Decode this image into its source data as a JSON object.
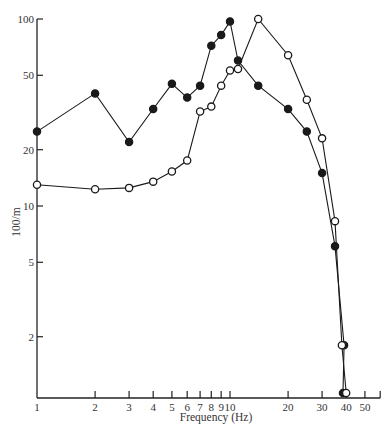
{
  "chart_data": {
    "type": "line",
    "title": "",
    "xlabel": "Frequency (Hz)",
    "ylabel": "100/m",
    "xscale": "log",
    "yscale": "log",
    "xlim": [
      1,
      60
    ],
    "ylim": [
      1,
      100
    ],
    "grid": false,
    "legend": null,
    "xticks": [
      1,
      2,
      3,
      4,
      5,
      6,
      7,
      8,
      9,
      10,
      20,
      30,
      40,
      50
    ],
    "xtick_labels": [
      "1",
      "2",
      "3",
      "4",
      "5",
      "6",
      "7",
      "8",
      "9",
      "10",
      "20",
      "30",
      "40",
      "50"
    ],
    "yticks": [
      2,
      5,
      10,
      20,
      50,
      100
    ],
    "ytick_labels": [
      "2",
      "5",
      "10",
      "20",
      "50",
      "100"
    ],
    "series": [
      {
        "name": "filled circles",
        "marker": "filled-circle",
        "x": [
          1,
          2,
          3,
          4,
          5,
          6,
          7,
          8,
          9,
          10,
          11,
          14,
          20,
          25,
          30,
          35,
          39,
          38.5
        ],
        "y": [
          25,
          40,
          22,
          33,
          45,
          38,
          44,
          72,
          82,
          97,
          60,
          44,
          33,
          25,
          15,
          6.1,
          1.8,
          1.0
        ]
      },
      {
        "name": "open circles",
        "marker": "open-circle",
        "x": [
          1,
          2,
          3,
          4,
          5,
          6,
          7,
          8,
          9,
          10,
          11,
          14,
          20,
          25,
          30,
          35,
          38,
          40
        ],
        "y": [
          13,
          12.3,
          12.5,
          13.5,
          15.3,
          17.5,
          32,
          34,
          44,
          53,
          54,
          100,
          64,
          37,
          23,
          8.3,
          1.8,
          1.0
        ]
      }
    ]
  }
}
